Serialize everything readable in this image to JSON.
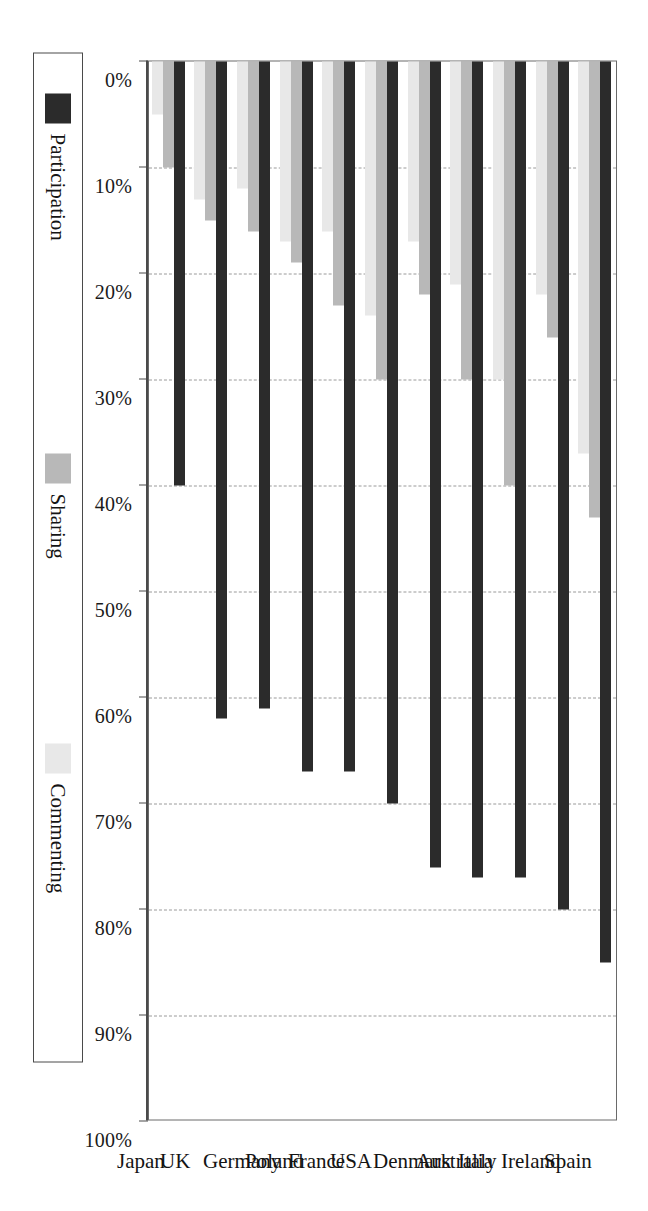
{
  "chart_data": {
    "type": "bar",
    "orientation": "horizontal-rotated",
    "title": "",
    "xlabel": "",
    "ylabel": "",
    "categories": [
      "Spain",
      "Ireland",
      "Italy",
      "Australia",
      "Denmark",
      "USA",
      "France",
      "Poland",
      "Germany",
      "UK",
      "Japan"
    ],
    "series": [
      {
        "name": "Participation",
        "color": "#2b2b2b",
        "values": [
          85,
          80,
          77,
          77,
          76,
          70,
          67,
          67,
          61,
          62,
          40
        ]
      },
      {
        "name": "Sharing",
        "color": "#b8b8b8",
        "values": [
          43,
          26,
          40,
          30,
          22,
          30,
          23,
          19,
          16,
          15,
          10
        ]
      },
      {
        "name": "Commenting",
        "color": "#e8e8e8",
        "values": [
          37,
          22,
          30,
          21,
          17,
          24,
          16,
          17,
          12,
          13,
          5
        ]
      }
    ],
    "axis": {
      "ticks": [
        0,
        10,
        20,
        30,
        40,
        50,
        60,
        70,
        80,
        90,
        100
      ],
      "tick_labels": [
        "0%",
        "10%",
        "20%",
        "30%",
        "40%",
        "50%",
        "60%",
        "70%",
        "80%",
        "90%",
        "100%"
      ],
      "min": 0,
      "max": 100,
      "unit": "%"
    },
    "grid": true,
    "legend_position": "bottom",
    "legend_entries": [
      "Participation",
      "Sharing",
      "Commenting"
    ]
  }
}
